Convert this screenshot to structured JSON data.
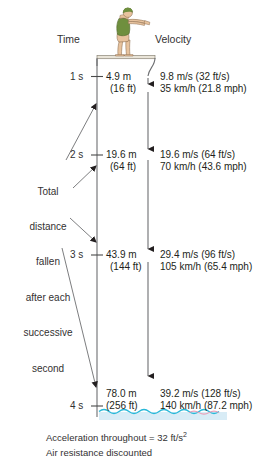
{
  "diagram": {
    "title_headers": {
      "time": "Time",
      "velocity": "Velocity"
    },
    "left_annotation": {
      "lines": [
        "Total",
        "distance",
        "fallen",
        "after each",
        "successive",
        "second"
      ],
      "text": "Total distance fallen after each successive second"
    },
    "figure": {
      "name": "diver-on-diving-board",
      "suit_color": "#6f8f3e",
      "cap_color": "#6f8f3e",
      "skin_color": "#e8c39e"
    },
    "water": {
      "name": "water-surface",
      "line_color": "#29b8d8",
      "fill_color": "#d8ecf6",
      "accent_color": "#e8a0b8"
    },
    "rows": [
      {
        "time": "1 s",
        "distance_m": "4.9 m",
        "distance_ft": "(16 ft)",
        "velocity_si": "9.8 m/s (32 ft/s)",
        "velocity_kmh": "35 km/h (21.8 mph)"
      },
      {
        "time": "2 s",
        "distance_m": "19.6 m",
        "distance_ft": "(64 ft)",
        "velocity_si": "19.6 m/s (64 ft/s)",
        "velocity_kmh": "70 km/h (43.6 mph)"
      },
      {
        "time": "3 s",
        "distance_m": "43.9 m",
        "distance_ft": "(144 ft)",
        "velocity_si": "29.4 m/s (96 ft/s)",
        "velocity_kmh": "105 km/h (65.4 mph)"
      },
      {
        "time": "4 s",
        "distance_m": "78.0 m",
        "distance_ft": "(256 ft)",
        "velocity_si": "39.2 m/s (128 ft/s)",
        "velocity_kmh": "140 km/h (87.2 mph)"
      }
    ],
    "caption": {
      "line1_prefix": "Acceleration throughout = 32 ft/s",
      "line1_exponent": "2",
      "line2": "Air resistance discounted"
    },
    "colors": {
      "line": "#6d6e71",
      "text": "#231f20",
      "arrow": "#231f20"
    }
  }
}
